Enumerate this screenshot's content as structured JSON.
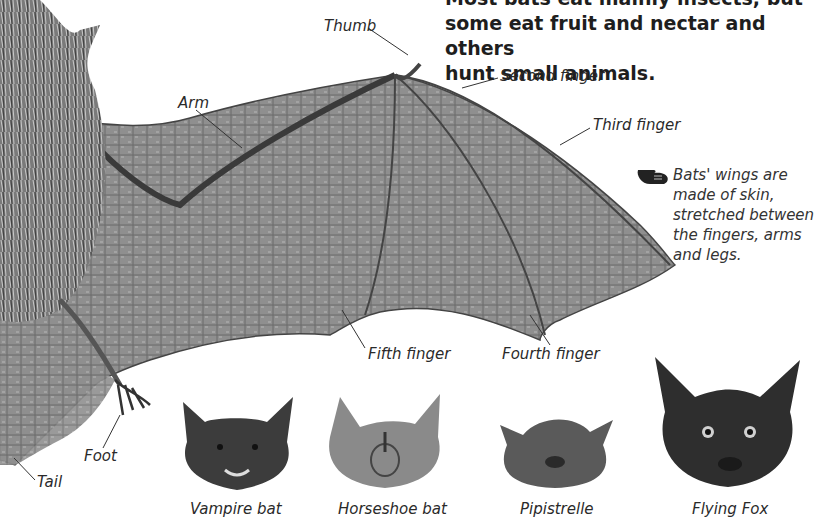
{
  "intro": {
    "line1": "Most bats eat mainly insects, but",
    "line2": "some eat fruit and nectar and others",
    "line3": "hunt small animals."
  },
  "note": {
    "icon": "pointing-hand-icon",
    "text": "Bats' wings are made of skin, stretched between the fingers, arms and legs."
  },
  "anatomy_labels": {
    "thumb": "Thumb",
    "arm": "Arm",
    "second_finger": "Second finger",
    "third_finger": "Third finger",
    "fifth_finger": "Fifth finger",
    "fourth_finger": "Fourth finger",
    "foot": "Foot",
    "tail": "Tail"
  },
  "bat_species": [
    {
      "name": "Vampire bat"
    },
    {
      "name": "Horseshoe bat"
    },
    {
      "name": "Pipistrelle"
    },
    {
      "name": "Flying Fox"
    }
  ]
}
